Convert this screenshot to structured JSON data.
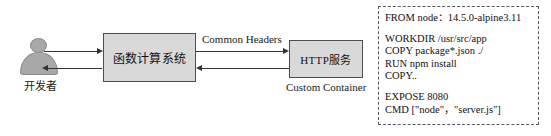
{
  "diagram": {
    "actor": {
      "label": "开发者",
      "icon": "person-icon"
    },
    "nodes": [
      {
        "id": "function-compute",
        "label": "函数计算系统"
      },
      {
        "id": "http-service",
        "label": "HTTP服务",
        "caption": "Custom Container"
      }
    ],
    "edges": [
      {
        "id": "dev-to-fc",
        "direction": "right",
        "label": ""
      },
      {
        "id": "fc-to-dev",
        "direction": "left",
        "label": ""
      },
      {
        "id": "fc-to-http",
        "direction": "right",
        "label": "Common Headers"
      },
      {
        "id": "http-to-fc",
        "direction": "left",
        "label": ""
      }
    ],
    "edge_labels": {
      "common_headers": "Common Headers"
    },
    "dockerfile": {
      "lines": [
        "FROM node：14.5.0-alpine3.11",
        "",
        "WORKDIR /usr/src/app",
        "COPY package*.json ./",
        "RUN npm install",
        "COPY..",
        "",
        "EXPOSE 8080",
        "CMD [\"node\"，\"server.js\"]"
      ]
    },
    "colors": {
      "node_fill": "#d9d9d9",
      "node_stroke": "#4d4d4d",
      "actor_fill": "#a8a8a8",
      "line": "#333333",
      "panel_border": "#555555",
      "background": "#ffffff"
    }
  }
}
